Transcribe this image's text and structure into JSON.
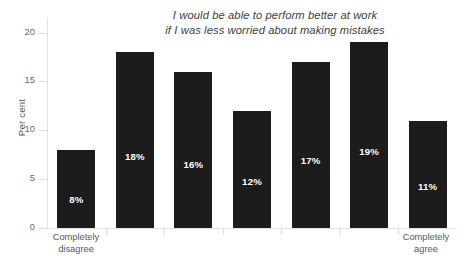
{
  "chart_data": {
    "type": "bar",
    "title": "I would be able to perform better at work if I was less worried about making mistakes",
    "title_lines": [
      "I would be able to perform better at work",
      "if I was less worried about making mistakes"
    ],
    "xlabel": "",
    "ylabel": "Per cent",
    "ylim": [
      0,
      21.5
    ],
    "yticks": [
      0,
      5,
      10,
      15,
      20
    ],
    "ytick_labels": [
      "0",
      "5",
      "10",
      "15",
      "20"
    ],
    "grid": false,
    "legend": false,
    "categories": [
      "Completely disagree",
      "",
      "",
      "",
      "",
      "",
      "Completely agree"
    ],
    "category_labels_shown": [
      "Completely disagree",
      "Completely agree"
    ],
    "values": [
      8,
      18,
      16,
      12,
      17,
      19,
      11
    ],
    "data_labels": [
      "8%",
      "18%",
      "16%",
      "12%",
      "17%",
      "19%",
      "11%"
    ],
    "bar_color": "#1c1c1c",
    "data_label_color": "#ffffff",
    "axis_color": "#e2e2e2",
    "text_color": "#5a5a5a"
  },
  "axis": {
    "y_title": "Per cent"
  },
  "xaxis": {
    "left_label_line1": "Completely",
    "left_label_line2": "disagree",
    "right_label_line1": "Completely",
    "right_label_line2": "agree"
  }
}
